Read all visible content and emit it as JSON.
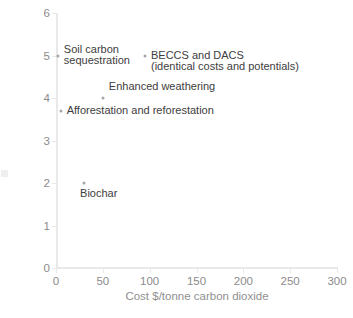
{
  "chart_data": {
    "type": "scatter",
    "title": "",
    "xlabel": "Cost $/tonne carbon dioxide",
    "ylabel": "Potential reductions (Gt CO2/year)",
    "xlim": [
      0,
      300
    ],
    "ylim": [
      0,
      6
    ],
    "xticks": [
      0,
      50,
      100,
      150,
      200,
      250,
      300
    ],
    "yticks": [
      0,
      1,
      2,
      3,
      4,
      5,
      6
    ],
    "xtick_labels": [
      "0",
      "50",
      "100",
      "150",
      "200",
      "250",
      "300"
    ],
    "ytick_labels": [
      "0",
      "1",
      "2",
      "3",
      "4",
      "5",
      "6"
    ],
    "grid": false,
    "legend": "none",
    "marker_color": "#a6a6a6",
    "axis_color": "#e9e9e9",
    "tick_label_color": "#8b8b8b",
    "axis_title_color": "#8f8f8f",
    "annotation_color": "#3d3d3d",
    "points": [
      {
        "name": "soil-carbon-sequestration",
        "x": 2,
        "y": 5.0,
        "label": "Soil carbon\nsequestration",
        "label_line1": "Soil carbon",
        "label_line2": "sequestration"
      },
      {
        "name": "beccs-and-dacs",
        "x": 95,
        "y": 5.0,
        "label": "BECCS and DACS\n(identical costs and potentials)",
        "label_line1": "BECCS and DACS",
        "label_line2": "(identical costs and potentials)"
      },
      {
        "name": "enhanced-weathering",
        "x": 50,
        "y": 4.0,
        "label": "Enhanced weathering",
        "label_line1": "Enhanced weathering",
        "label_line2": ""
      },
      {
        "name": "afforestation-and-reforestation",
        "x": 5,
        "y": 3.7,
        "label": "Afforestation and reforestation",
        "label_line1": "Afforestation and reforestation",
        "label_line2": ""
      },
      {
        "name": "biochar",
        "x": 30,
        "y": 2.0,
        "label": "Biochar",
        "label_line1": "Biochar",
        "label_line2": ""
      }
    ]
  },
  "artifacts": {
    "bottom_cut_text": ""
  }
}
